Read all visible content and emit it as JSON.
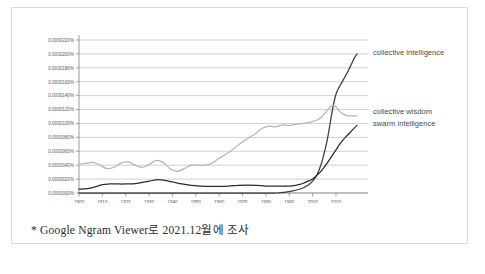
{
  "caption": "* Google  Ngram Viewer로 2021.12월에 조사",
  "colors": {
    "frame_border": "#dcdcdc",
    "gridline": "#bfbfbf",
    "axis": "#808080",
    "tick_text": "#595959",
    "label_text": "#4a4a4a",
    "collective_intelligence": "#3d3d3d",
    "collective_wisdom": "#b5b5b5",
    "swarm_intelligence": "#2b2b2b",
    "background": "#ffffff"
  },
  "chart_data": {
    "type": "line",
    "title": "",
    "xlabel": "",
    "ylabel": "",
    "grid": true,
    "legend_position": "right-inline-annotations",
    "xlim": [
      1900,
      2019
    ],
    "ylim": [
      0.0,
      2.2e-06
    ],
    "x_tick_labels": [
      "1900",
      "1910",
      "1920",
      "1930",
      "1940",
      "1950",
      "1960",
      "1970",
      "1980",
      "1990",
      "2000",
      "2010"
    ],
    "x_ticks": [
      1900,
      1910,
      1920,
      1930,
      1940,
      1950,
      1960,
      1970,
      1980,
      1990,
      2000,
      2010
    ],
    "y_tick_labels": [
      "0.0000220%",
      "0.0000200%",
      "0.0000180%",
      "0.0000160%",
      "0.0000140%",
      "0.0000120%",
      "0.0000100%",
      "0.0000080%",
      "0.0000060%",
      "0.0000040%",
      "0.0000020%",
      "0.0000000%"
    ],
    "y_ticks": [
      2.2e-06,
      2e-06,
      1.8e-06,
      1.6e-06,
      1.4e-06,
      1.2e-06,
      1e-06,
      8e-07,
      6e-07,
      4e-07,
      2e-07,
      0.0
    ],
    "series": [
      {
        "name": "collective intelligence",
        "color": "#3d3d3d",
        "label_x": 2021,
        "label_y": 2.02e-06,
        "x": [
          1900,
          1910,
          1920,
          1930,
          1940,
          1950,
          1960,
          1965,
          1970,
          1975,
          1980,
          1985,
          1988,
          1990,
          1992,
          1994,
          1996,
          1998,
          2000,
          2002,
          2004,
          2005,
          2006,
          2007,
          2008,
          2009,
          2010,
          2011,
          2012,
          2013,
          2014,
          2015,
          2016,
          2017,
          2018,
          2019
        ],
        "values": [
          0.0,
          0.0,
          0.0,
          0.0,
          0.0,
          0.0,
          0.0,
          0.0,
          0.0,
          0.0,
          0.0,
          0.0,
          1e-08,
          2e-08,
          3.5e-08,
          5e-08,
          7.5e-08,
          1.1e-07,
          1.7e-07,
          2.7e-07,
          4.5e-07,
          5.8e-07,
          7.2e-07,
          9e-07,
          1.1e-06,
          1.28e-06,
          1.42e-06,
          1.5e-06,
          1.56e-06,
          1.62e-06,
          1.68e-06,
          1.74e-06,
          1.81e-06,
          1.88e-06,
          1.95e-06,
          2e-06
        ]
      },
      {
        "name": "collective wisdom",
        "color": "#b5b5b5",
        "label_x": 2021,
        "label_y": 1.18e-06,
        "x": [
          1900,
          1903,
          1906,
          1909,
          1912,
          1915,
          1918,
          1921,
          1924,
          1927,
          1930,
          1933,
          1936,
          1939,
          1942,
          1945,
          1948,
          1951,
          1954,
          1957,
          1960,
          1963,
          1966,
          1969,
          1972,
          1975,
          1978,
          1980,
          1982,
          1984,
          1986,
          1988,
          1990,
          1993,
          1996,
          1999,
          2002,
          2004,
          2006,
          2008,
          2009,
          2010,
          2012,
          2014,
          2016,
          2018,
          2019
        ],
        "values": [
          4.1e-07,
          4.3e-07,
          4.4e-07,
          4e-07,
          3.5e-07,
          3.7e-07,
          4.3e-07,
          4.5e-07,
          4e-07,
          3.7e-07,
          4.1e-07,
          4.7e-07,
          4.4e-07,
          3.5e-07,
          3.1e-07,
          3.5e-07,
          4e-07,
          4e-07,
          4e-07,
          4.3e-07,
          5e-07,
          5.6e-07,
          6.3e-07,
          7.1e-07,
          7.8e-07,
          8.4e-07,
          9.2e-07,
          9.5e-07,
          9.6e-07,
          9.5e-07,
          9.7e-07,
          9.8e-07,
          9.7e-07,
          9.9e-07,
          1e-06,
          1.02e-06,
          1.05e-06,
          1.1e-06,
          1.18e-06,
          1.25e-06,
          1.26e-06,
          1.24e-06,
          1.16e-06,
          1.12e-06,
          1.11e-06,
          1.11e-06,
          1.11e-06
        ]
      },
      {
        "name": "swarm intelligence",
        "color": "#2b2b2b",
        "label_x": 2021,
        "label_y": 1e-06,
        "x": [
          1900,
          1905,
          1910,
          1913,
          1916,
          1920,
          1925,
          1930,
          1933,
          1936,
          1940,
          1944,
          1948,
          1952,
          1956,
          1960,
          1964,
          1968,
          1972,
          1976,
          1980,
          1984,
          1988,
          1990,
          1992,
          1994,
          1996,
          1998,
          2000,
          2002,
          2004,
          2006,
          2008,
          2010,
          2012,
          2014,
          2016,
          2018,
          2019
        ],
        "values": [
          5.5e-08,
          7e-08,
          1.2e-07,
          1.3e-07,
          1.3e-07,
          1.3e-07,
          1.4e-07,
          1.7e-07,
          1.9e-07,
          1.85e-07,
          1.6e-07,
          1.3e-07,
          1.1e-07,
          1e-07,
          9.5e-08,
          9.5e-08,
          1e-07,
          1.1e-07,
          1.15e-07,
          1.1e-07,
          1e-07,
          1e-07,
          1e-07,
          1e-07,
          1.05e-07,
          1.2e-07,
          1.4e-07,
          1.7e-07,
          2e-07,
          2.6e-07,
          3.3e-07,
          4.2e-07,
          5.2e-07,
          6.2e-07,
          7.2e-07,
          8e-07,
          8.7e-07,
          9.4e-07,
          9.7e-07
        ]
      }
    ]
  }
}
